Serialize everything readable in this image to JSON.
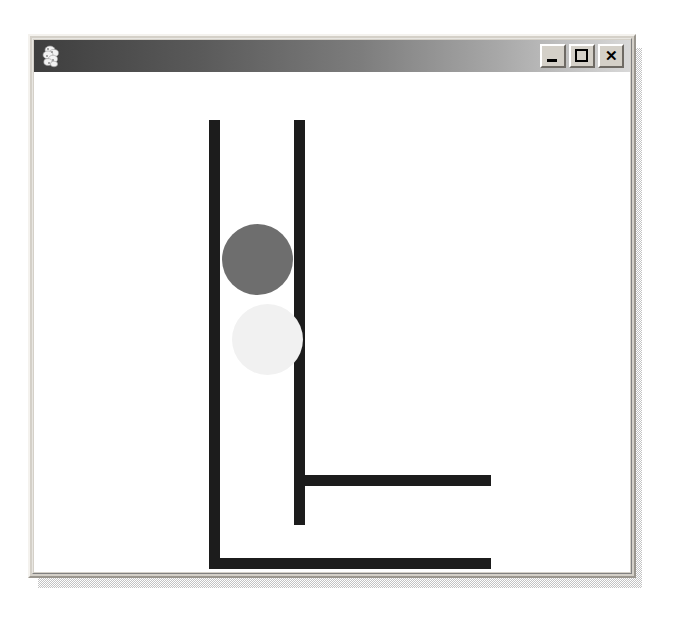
{
  "window": {
    "title": "",
    "icon": "application-icon",
    "background_color": "#d4d0c8",
    "canvas_color": "#ffffff",
    "controls": [
      {
        "name": "minimize",
        "glyph": "_"
      },
      {
        "name": "maximize",
        "glyph": "□"
      },
      {
        "name": "close",
        "glyph": "×"
      }
    ],
    "titlebar": {
      "gradient_from": "#3e3e3e",
      "gradient_to": "#d8d8d8"
    }
  },
  "canvas": {
    "description": "Two black L-shaped tracks with two circles between the vertical rails",
    "shape_color": "#1c1c1c",
    "shapes": [
      {
        "name": "outer-track-vertical",
        "type": "bar",
        "color": "#1c1c1c",
        "x": 175,
        "y": 48,
        "width": 11,
        "height": 449
      },
      {
        "name": "outer-track-horizontal",
        "type": "bar",
        "color": "#1c1c1c",
        "x": 175,
        "y": 486,
        "width": 282,
        "height": 11
      },
      {
        "name": "inner-track-vertical",
        "type": "bar",
        "color": "#1c1c1c",
        "x": 260,
        "y": 48,
        "width": 11,
        "height": 405
      },
      {
        "name": "inner-track-horizontal",
        "type": "bar",
        "color": "#1c1c1c",
        "x": 260,
        "y": 403,
        "width": 197,
        "height": 11
      },
      {
        "name": "dark-ball",
        "type": "circle",
        "color": "#6e6e6e",
        "x": 188,
        "y": 152,
        "width": 71,
        "height": 71
      },
      {
        "name": "light-ball",
        "type": "circle",
        "color": "#f1f1f1",
        "x": 198,
        "y": 232,
        "width": 71,
        "height": 71
      }
    ]
  }
}
